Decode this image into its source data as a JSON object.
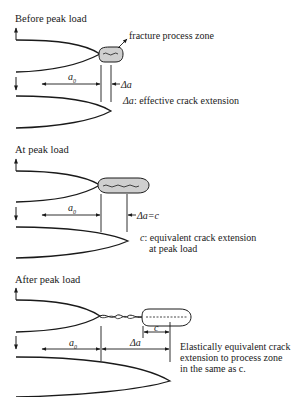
{
  "colors": {
    "line": "#1a1a1a",
    "process_zone_fill": "#cfcfcf",
    "background": "#ffffff"
  },
  "panels": [
    {
      "title": "Before peak load",
      "process_zone_label": "fracture process zone",
      "dim_a0": "a",
      "dim_a0_sub": "0",
      "dim_delta": "Δa",
      "note_symbol": "Δa",
      "note_text": ": effective crack extension"
    },
    {
      "title": "At peak load",
      "dim_a0": "a",
      "dim_a0_sub": "0",
      "dim_delta": "Δa=c",
      "note_symbol": "c",
      "note_line1": ": equivalent crack extension",
      "note_line2": "at peak load"
    },
    {
      "title": "After peak load",
      "dim_a0": "a",
      "dim_a0_sub": "0",
      "dim_delta": "Δa",
      "dim_c": "c",
      "note_line1": "Elastically equivalent crack",
      "note_line2": "extension to process zone",
      "note_line3": "in the same as c."
    }
  ]
}
